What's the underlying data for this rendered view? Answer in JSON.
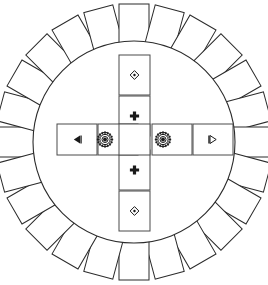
{
  "figure": {
    "background_color": "#ffffff",
    "stroke_color": "#2b2b2b",
    "width": 268,
    "height": 285
  },
  "circle": {
    "name": "main-circle",
    "center_x": 134,
    "center_y": 142,
    "radius_x": 101,
    "radius_y": 101,
    "fill": "#ffffff",
    "stroke": "#2b2b2b"
  },
  "outer_ring": {
    "count": 24,
    "card_width": 30,
    "card_height": 40,
    "orbit_radius": 118,
    "start_angle_deg": -90,
    "step_angle_deg": 15,
    "cards": [
      {
        "index": 1,
        "angle": -90,
        "label": ""
      },
      {
        "index": 2,
        "angle": -75,
        "label": ""
      },
      {
        "index": 3,
        "angle": -60,
        "label": ""
      },
      {
        "index": 4,
        "angle": -45,
        "label": ""
      },
      {
        "index": 5,
        "angle": -30,
        "label": ""
      },
      {
        "index": 6,
        "angle": -15,
        "label": ""
      },
      {
        "index": 7,
        "angle": 0,
        "label": ""
      },
      {
        "index": 8,
        "angle": 15,
        "label": ""
      },
      {
        "index": 9,
        "angle": 30,
        "label": ""
      },
      {
        "index": 10,
        "angle": 45,
        "label": ""
      },
      {
        "index": 11,
        "angle": 60,
        "label": ""
      },
      {
        "index": 12,
        "angle": 75,
        "label": ""
      },
      {
        "index": 13,
        "angle": 90,
        "label": ""
      },
      {
        "index": 14,
        "angle": 105,
        "label": ""
      },
      {
        "index": 15,
        "angle": 120,
        "label": ""
      },
      {
        "index": 16,
        "angle": 135,
        "label": ""
      },
      {
        "index": 17,
        "angle": 150,
        "label": ""
      },
      {
        "index": 18,
        "angle": 165,
        "label": ""
      },
      {
        "index": 19,
        "angle": 180,
        "label": ""
      },
      {
        "index": 20,
        "angle": 195,
        "label": ""
      },
      {
        "index": 21,
        "angle": 210,
        "label": ""
      },
      {
        "index": 22,
        "angle": 225,
        "label": ""
      },
      {
        "index": 23,
        "angle": 240,
        "label": ""
      },
      {
        "index": 24,
        "angle": 255,
        "label": ""
      }
    ]
  },
  "cross": {
    "name": "inner-cross",
    "center_cell": {
      "name": "center-cell",
      "icon": "none",
      "label": ""
    },
    "arms": [
      {
        "position": "top-outer",
        "icon": "diamond-icon",
        "orientation": "vertical",
        "x": 119,
        "y": 55,
        "width": 31,
        "height": 40,
        "label": ""
      },
      {
        "position": "top-inner",
        "icon": "plus-icon",
        "orientation": "vertical",
        "x": 119,
        "y": 96,
        "width": 31,
        "height": 40,
        "label": ""
      },
      {
        "position": "bottom-inner",
        "icon": "plus-icon",
        "orientation": "vertical",
        "x": 119,
        "y": 150,
        "width": 31,
        "height": 40,
        "label": ""
      },
      {
        "position": "bottom-outer",
        "icon": "diamond-icon",
        "orientation": "vertical",
        "x": 119,
        "y": 191,
        "width": 31,
        "height": 40,
        "label": ""
      },
      {
        "position": "left-outer",
        "icon": "triangle-left-icon",
        "orientation": "horizontal",
        "x": 57,
        "y": 124,
        "width": 40,
        "height": 31,
        "label": ""
      },
      {
        "position": "left-inner",
        "icon": "gear-icon",
        "orientation": "horizontal",
        "x": 98,
        "y": 124,
        "width": 40,
        "height": 31,
        "label": ""
      },
      {
        "position": "right-inner",
        "icon": "gear-icon",
        "orientation": "horizontal",
        "x": 152,
        "y": 124,
        "width": 40,
        "height": 31,
        "label": ""
      },
      {
        "position": "right-outer",
        "icon": "triangle-right-icon",
        "orientation": "horizontal",
        "x": 193,
        "y": 124,
        "width": 40,
        "height": 31,
        "label": ""
      }
    ]
  }
}
